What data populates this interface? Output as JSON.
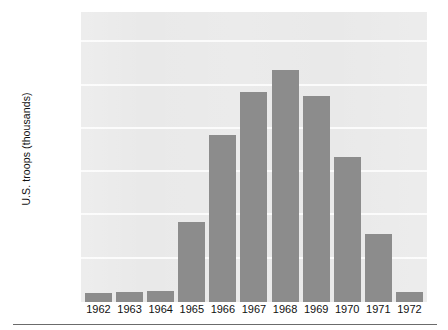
{
  "chart": {
    "ylabel": "U.S. troops (thousands)",
    "bar_color": "#8c8c8c",
    "plot_background": "#e9e9e9",
    "gridline_color": "#fbfbfb"
  },
  "chart_data": {
    "type": "bar",
    "title": "",
    "xlabel": "",
    "ylabel": "U.S. troops (thousands)",
    "categories": [
      "1962",
      "1963",
      "1964",
      "1965",
      "1966",
      "1967",
      "1968",
      "1969",
      "1970",
      "1971",
      "1972"
    ],
    "values": [
      20,
      23,
      25,
      184,
      385,
      486,
      536,
      475,
      335,
      157,
      24
    ],
    "yticks": [
      100,
      200,
      300,
      400,
      500,
      600
    ],
    "ytick_labels": [
      "100",
      "200",
      "300",
      "400",
      "500",
      "600"
    ],
    "ylim": [
      0,
      670
    ],
    "grid": true,
    "legend": false,
    "series": [
      {
        "name": "U.S. troops (thousands)",
        "values": [
          20,
          23,
          25,
          184,
          385,
          486,
          536,
          475,
          335,
          157,
          24
        ]
      }
    ]
  }
}
